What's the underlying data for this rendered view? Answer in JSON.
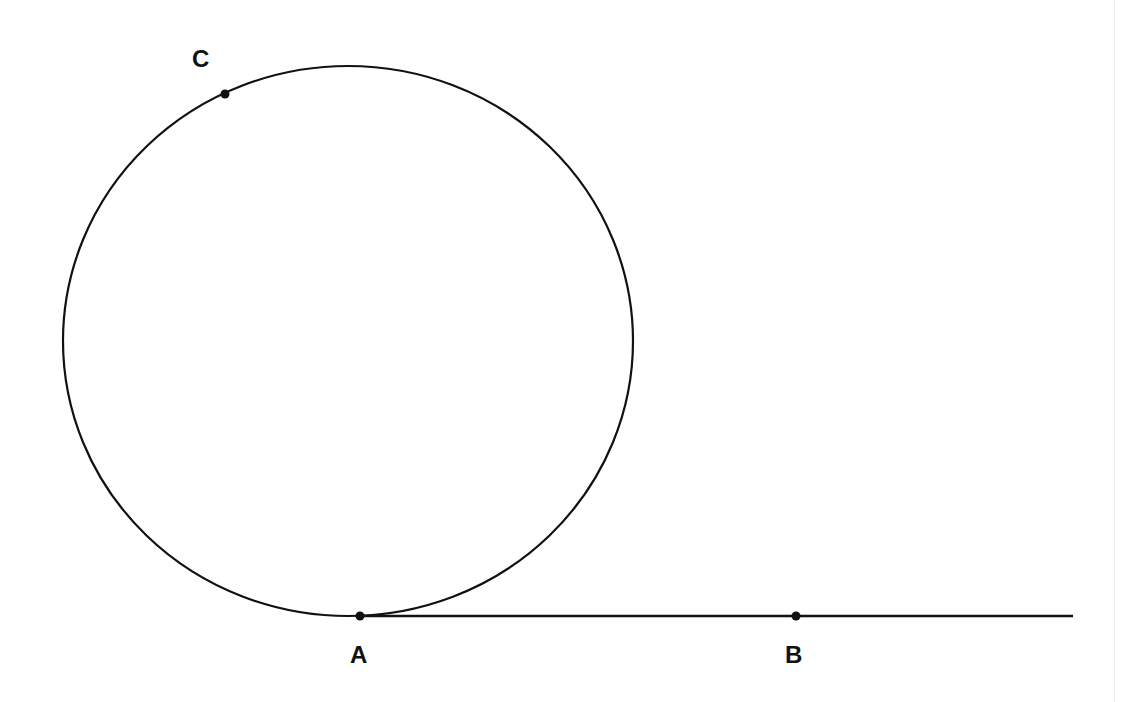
{
  "diagram": {
    "colors": {
      "stroke": "#111111",
      "background": "#ffffff"
    },
    "circle": {
      "cx": 348,
      "cy": 341,
      "rx": 285,
      "ry": 275
    },
    "line": {
      "x1": 360,
      "y1": 616,
      "x2": 1073,
      "y2": 616
    },
    "points": [
      {
        "id": "A",
        "label": "A",
        "x": 360,
        "y": 616,
        "label_x": 350,
        "label_y": 643
      },
      {
        "id": "B",
        "label": "B",
        "x": 796,
        "y": 616,
        "label_x": 785,
        "label_y": 643
      },
      {
        "id": "C",
        "label": "C",
        "x": 225,
        "y": 94,
        "label_x": 192,
        "label_y": 47
      }
    ]
  }
}
